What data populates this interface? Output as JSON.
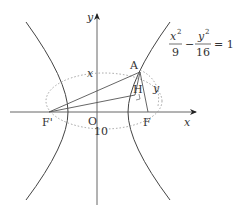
{
  "diagram": {
    "type": "hyperbola-focal-triangle",
    "equation": {
      "term1_num": "x",
      "term1_exp": "2",
      "term1_den": "9",
      "minus": "−",
      "term2_num": "y",
      "term2_exp": "2",
      "term2_den": "16",
      "equals": "= 1"
    },
    "axes": {
      "x_label": "x",
      "y_label": "y",
      "origin_label": "O"
    },
    "points": {
      "A": "A",
      "H": "H",
      "F": "F",
      "F_prime": "F'"
    },
    "segment_labels": {
      "AF_prime": "x",
      "AF": "y",
      "F_prime_F": "10"
    },
    "colors": {
      "curve": "#444444",
      "axis": "#666666",
      "dotted": "#999999",
      "text": "#333333"
    }
  }
}
